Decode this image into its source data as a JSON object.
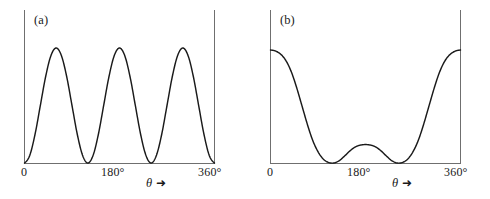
{
  "figure": {
    "panels": [
      {
        "tag": "(a)",
        "axis": {
          "x_ticks": [
            {
              "label": "0",
              "value": 0
            },
            {
              "label": "180°",
              "value": 180
            },
            {
              "label": "360°",
              "value": 360
            }
          ],
          "x_axis_label_symbol": "θ",
          "x_axis_label_arrow": "➜"
        }
      },
      {
        "tag": "(b)",
        "axis": {
          "x_ticks": [
            {
              "label": "0",
              "value": 0
            },
            {
              "label": "180°",
              "value": 180
            },
            {
              "label": "360°",
              "value": 360
            }
          ],
          "x_axis_label_symbol": "θ",
          "x_axis_label_arrow": "➜"
        }
      }
    ],
    "colors": {
      "curve": "#1a1a1a",
      "axis": "#6f6f6f",
      "background": "#ffffff",
      "text": "#1a1a1a"
    }
  },
  "chart_data": [
    {
      "type": "line",
      "title": "(a)",
      "xlabel": "θ",
      "ylabel": "",
      "xlim": [
        0,
        360
      ],
      "ylim": [
        0,
        1
      ],
      "grid": false,
      "legend": "none",
      "xtick_values": [
        0,
        180,
        360
      ],
      "xtick_labels": [
        "0",
        "180°",
        "360°"
      ],
      "ytick_labels": [],
      "description": "Three equal lobes; zeros at 0°, 120°, 240°, 360°; maxima of equal height at 60°, 180°, 300° (sin²(3θ/2) form)",
      "x": [
        0,
        10,
        20,
        30,
        40,
        50,
        60,
        70,
        80,
        90,
        100,
        110,
        120,
        130,
        140,
        150,
        160,
        170,
        180,
        190,
        200,
        210,
        220,
        230,
        240,
        250,
        260,
        270,
        280,
        290,
        300,
        310,
        320,
        330,
        340,
        350,
        360
      ],
      "y": [
        0.0,
        0.067,
        0.25,
        0.5,
        0.75,
        0.933,
        1.0,
        0.933,
        0.75,
        0.5,
        0.25,
        0.067,
        0.0,
        0.067,
        0.25,
        0.5,
        0.75,
        0.933,
        1.0,
        0.933,
        0.75,
        0.5,
        0.25,
        0.067,
        0.0,
        0.067,
        0.25,
        0.5,
        0.75,
        0.933,
        1.0,
        0.933,
        0.75,
        0.5,
        0.25,
        0.067,
        0.0
      ],
      "peaks": [
        {
          "x": 60,
          "y": 1.0
        },
        {
          "x": 180,
          "y": 1.0
        },
        {
          "x": 300,
          "y": 1.0
        }
      ],
      "zeros": [
        0,
        120,
        240,
        360
      ]
    },
    {
      "type": "line",
      "title": "(b)",
      "xlabel": "θ",
      "ylabel": "",
      "xlim": [
        0,
        360
      ],
      "ylim": [
        0,
        1
      ],
      "grid": false,
      "legend": "none",
      "xtick_values": [
        0,
        180,
        360
      ],
      "xtick_labels": [
        "0",
        "180°",
        "360°"
      ],
      "ytick_labels": [],
      "description": "Large lobes at the ends (θ = 0° and 360°) with a small central bump at 180°; zeros at 120° and 240°",
      "x": [
        0,
        10,
        20,
        30,
        40,
        50,
        60,
        70,
        80,
        90,
        100,
        110,
        120,
        130,
        140,
        150,
        160,
        170,
        180,
        190,
        200,
        210,
        220,
        230,
        240,
        250,
        260,
        270,
        280,
        290,
        300,
        310,
        320,
        330,
        340,
        350,
        360
      ],
      "y": [
        1.0,
        0.99,
        0.96,
        0.9,
        0.8,
        0.66,
        0.5,
        0.34,
        0.2,
        0.1,
        0.035,
        0.005,
        0.0,
        0.02,
        0.06,
        0.105,
        0.14,
        0.158,
        0.163,
        0.158,
        0.14,
        0.105,
        0.06,
        0.02,
        0.0,
        0.005,
        0.035,
        0.1,
        0.2,
        0.34,
        0.5,
        0.66,
        0.8,
        0.9,
        0.96,
        0.99,
        1.0
      ],
      "peaks": [
        {
          "x": 0,
          "y": 1.0
        },
        {
          "x": 180,
          "y": 0.163
        },
        {
          "x": 360,
          "y": 1.0
        }
      ],
      "zeros": [
        120,
        240
      ]
    }
  ]
}
